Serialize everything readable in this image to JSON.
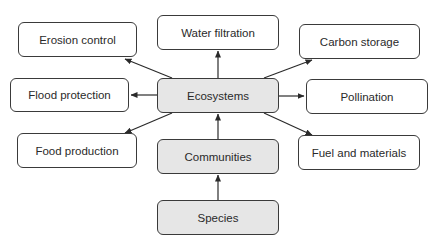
{
  "diagram": {
    "colors": {
      "core_fill": "#e6e6e6",
      "service_fill": "#ffffff",
      "stroke": "#3a3a3a",
      "text": "#2a2a2a"
    },
    "core_nodes": [
      {
        "id": "species",
        "label": "Species"
      },
      {
        "id": "communities",
        "label": "Communities"
      },
      {
        "id": "ecosystems",
        "label": "Ecosystems"
      }
    ],
    "service_nodes": [
      {
        "id": "erosion",
        "label": "Erosion control"
      },
      {
        "id": "water",
        "label": "Water filtration"
      },
      {
        "id": "carbon",
        "label": "Carbon storage"
      },
      {
        "id": "flood",
        "label": "Flood protection"
      },
      {
        "id": "pollination",
        "label": "Pollination"
      },
      {
        "id": "food",
        "label": "Food production"
      },
      {
        "id": "fuel",
        "label": "Fuel and materials"
      }
    ],
    "edges": [
      {
        "from": "species",
        "to": "communities"
      },
      {
        "from": "communities",
        "to": "ecosystems"
      },
      {
        "from": "ecosystems",
        "to": "erosion"
      },
      {
        "from": "ecosystems",
        "to": "water"
      },
      {
        "from": "ecosystems",
        "to": "carbon"
      },
      {
        "from": "ecosystems",
        "to": "flood"
      },
      {
        "from": "ecosystems",
        "to": "pollination"
      },
      {
        "from": "ecosystems",
        "to": "food"
      },
      {
        "from": "ecosystems",
        "to": "fuel"
      }
    ]
  }
}
